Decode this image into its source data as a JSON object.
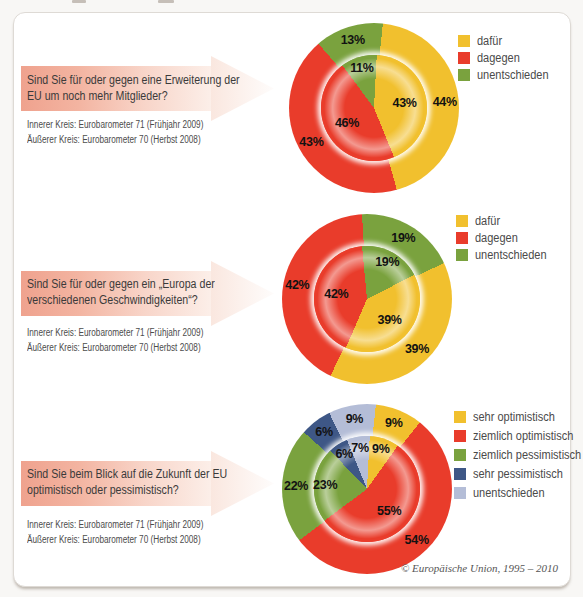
{
  "page": {
    "copyright": "© Europäische Union, 1995 – 2010"
  },
  "sections": [
    {
      "question": "Sind Sie für oder gegen eine Erweiterung der EU um noch mehr Mitglieder?",
      "caption_inner": "Innerer Kreis: Eurobarometer 71 (Frühjahr 2009)",
      "caption_outer": "Äußerer Kreis: Eurobarometer 70 (Herbst 2008)"
    },
    {
      "question": "Sind Sie für oder gegen ein „Europa der verschiedenen Geschwindigkeiten“?",
      "caption_inner": "Innerer Kreis: Eurobarometer 71 (Frühjahr 2009)",
      "caption_outer": "Äußerer Kreis: Eurobarometer 70 (Herbst 2008)"
    },
    {
      "question": "Sind Sie beim Blick auf die Zukunft der EU optimistisch oder pessimistisch?",
      "caption_inner": "Innerer Kreis: Eurobarometer 71 (Frühjahr 2009)",
      "caption_outer": "Äußerer Kreis: Eurobarometer 70 (Herbst 2008)"
    }
  ],
  "chart_data": [
    {
      "type": "pie",
      "variant": "double_donut",
      "title": "Sind Sie für oder gegen eine Erweiterung der EU um noch mehr Mitglieder?",
      "units": "%",
      "legend_position": "top-right",
      "categories": [
        "dafür",
        "dagegen",
        "unentschieden"
      ],
      "colors": [
        "#f1c02e",
        "#e93c2b",
        "#7aa23e"
      ],
      "rings": [
        {
          "name": "Äußerer Kreis: Eurobarometer 70 (Herbst 2008)",
          "position": "outer",
          "values": [
            44,
            43,
            13
          ],
          "start_angle": 6
        },
        {
          "name": "Innerer Kreis: Eurobarometer 71 (Frühjahr 2009)",
          "position": "inner",
          "values": [
            43,
            46,
            11
          ],
          "start_angle": 3
        }
      ]
    },
    {
      "type": "pie",
      "variant": "double_donut",
      "title": "Sind Sie für oder gegen ein „Europa der verschiedenen Geschwindigkeiten“?",
      "units": "%",
      "legend_position": "top-right",
      "categories": [
        "dafür",
        "dagegen",
        "unentschieden"
      ],
      "colors": [
        "#f1c02e",
        "#e93c2b",
        "#7aa23e"
      ],
      "rings": [
        {
          "name": "Äußerer Kreis: Eurobarometer 70 (Herbst 2008)",
          "position": "outer",
          "values": [
            39,
            42,
            19
          ],
          "start_angle": 65
        },
        {
          "name": "Innerer Kreis: Eurobarometer 71 (Frühjahr 2009)",
          "position": "inner",
          "values": [
            39,
            42,
            19
          ],
          "start_angle": 63
        }
      ]
    },
    {
      "type": "pie",
      "variant": "double_donut",
      "title": "Sind Sie beim Blick auf die Zukunft der EU optimistisch oder pessimistisch?",
      "units": "%",
      "legend_position": "top-right",
      "categories": [
        "sehr optimistisch",
        "ziemlich optimistisch",
        "ziemlich pessimistisch",
        "sehr pessimistisch",
        "unentschieden"
      ],
      "colors": [
        "#f1c02e",
        "#e93c2b",
        "#7aa23e",
        "#3e5786",
        "#b4bdd7"
      ],
      "rings": [
        {
          "name": "Äußerer Kreis: Eurobarometer 70 (Herbst 2008)",
          "position": "outer",
          "values": [
            9,
            54,
            22,
            6,
            9
          ],
          "start_angle": 6
        },
        {
          "name": "Innerer Kreis: Eurobarometer 71 (Frühjahr 2009)",
          "position": "inner",
          "values": [
            9,
            55,
            23,
            6,
            7
          ],
          "start_angle": 3
        }
      ]
    }
  ]
}
